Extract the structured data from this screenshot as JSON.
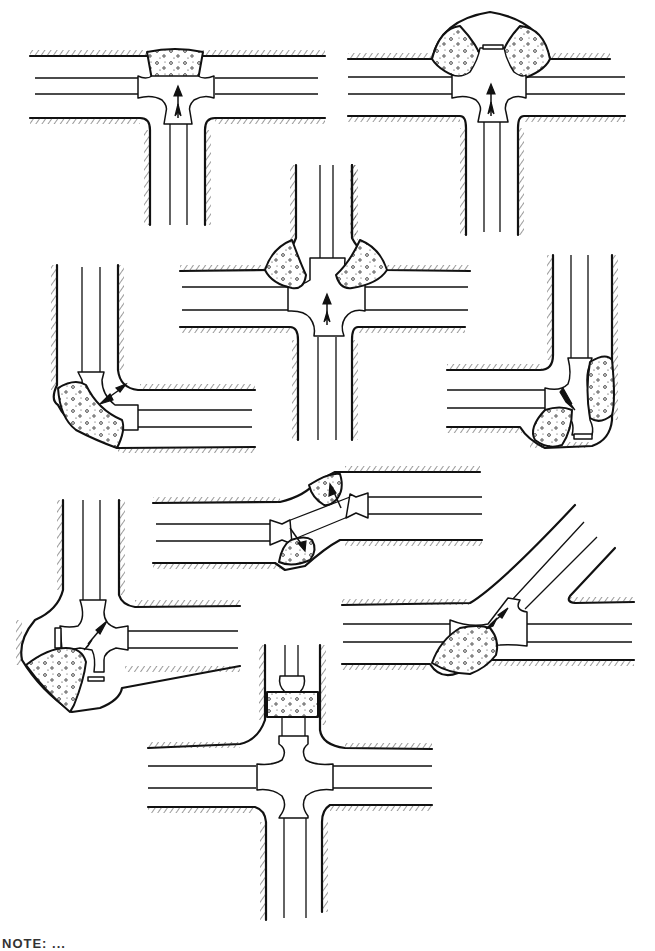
{
  "figure": {
    "type": "technical illustration",
    "caption_partial": "NOTE: ...",
    "colors": {
      "ink": "#111111",
      "background": "#ffffff",
      "concrete_fill": "#ffffff"
    }
  },
  "panels": [
    {
      "id": "tee-single-block",
      "fitting": "tee",
      "blocks": 1,
      "thrust_direction": "up",
      "position": "top-left"
    },
    {
      "id": "tee-double-block",
      "fitting": "tee",
      "blocks": 2,
      "thrust_direction": "up",
      "position": "top-right"
    },
    {
      "id": "cross-plugged",
      "fitting": "cross with plugged leg",
      "blocks": 2,
      "thrust_direction": "up",
      "position": "center"
    },
    {
      "id": "elbow-90",
      "fitting": "90-degree bend",
      "blocks": 1,
      "thrust_direction": "outward diagonal",
      "position": "middle-left"
    },
    {
      "id": "tee-plugged-bend",
      "fitting": "tee with plug",
      "blocks": 2,
      "thrust_direction": "diagonal",
      "position": "middle-right"
    },
    {
      "id": "offset-bends",
      "fitting": "offset (two bends)",
      "blocks": 2,
      "thrust_direction": "opposing diagonals",
      "position": "middle-center"
    },
    {
      "id": "cross-two-plugs",
      "fitting": "cross with two plugs",
      "blocks": 1,
      "thrust_direction": "diagonal",
      "position": "lower-left"
    },
    {
      "id": "wye-branch",
      "fitting": "wye / lateral",
      "blocks": 1,
      "thrust_direction": "diagonal",
      "position": "lower-right"
    },
    {
      "id": "cross-reducer",
      "fitting": "cross with reducer",
      "blocks": 1,
      "thrust_direction": "none shown",
      "position": "bottom-center"
    }
  ]
}
